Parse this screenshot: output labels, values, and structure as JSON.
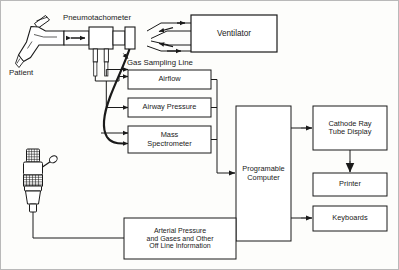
{
  "figure": {
    "width": 399,
    "height": 270,
    "line_color": "#1a1a1a",
    "box_fill": "#ffffff",
    "background": "#fdfdfb"
  },
  "boxes": {
    "ventilator": {
      "label": "Ventilator",
      "x": 190,
      "y": 14,
      "w": 86,
      "h": 37,
      "font_size": 8.2
    },
    "airflow": {
      "label": "Airflow",
      "x": 127,
      "y": 69,
      "w": 83,
      "h": 19,
      "font_size": 7.4
    },
    "airway_pressure": {
      "label": "Airway Pressure",
      "x": 127,
      "y": 97,
      "w": 83,
      "h": 19,
      "font_size": 7.4
    },
    "mass_spectrometer": {
      "label": "Mass\nSpectrometer",
      "x": 127,
      "y": 125,
      "w": 83,
      "h": 27,
      "font_size": 7.4
    },
    "computer": {
      "label": "Programable\nComputer",
      "x": 235,
      "y": 105,
      "w": 55,
      "h": 135,
      "font_size": 7.4
    },
    "crt": {
      "label": "Cathode Ray\nTube Display",
      "x": 312,
      "y": 105,
      "w": 74,
      "h": 44,
      "font_size": 7.4
    },
    "printer": {
      "label": "Printer",
      "x": 312,
      "y": 172,
      "w": 74,
      "h": 23,
      "font_size": 7.4
    },
    "keyboards": {
      "label": "Keyboards",
      "x": 312,
      "y": 205,
      "w": 74,
      "h": 25,
      "font_size": 7.4
    },
    "arterial": {
      "label": "Arterial Pressure\nand Gases and Other\nOff Line Information",
      "x": 123,
      "y": 217,
      "w": 112,
      "h": 41,
      "font_size": 7.0
    }
  },
  "labels": {
    "pneumotachometer": {
      "text": "Pneumotachometer",
      "x": 62,
      "y": 13,
      "font_size": 7.8
    },
    "patient": {
      "text": "Patient",
      "x": 8,
      "y": 68,
      "font_size": 7.8
    },
    "gas_sampling_line": {
      "text": "Gas Sampling Line",
      "x": 126,
      "y": 58,
      "font_size": 7.8
    }
  },
  "icons": {
    "patient_elbow_connector": "patient-elbow-connector-icon",
    "pneumotach_body": "pneumotachometer-icon",
    "sampling_ports": "sampling-port-icon",
    "pressure_transducer": "pressure-transducer-icon",
    "ventilator_flow_arrows": "flow-arrow-icon",
    "bidirectional_flow": "bidirectional-flow-arrow-icon"
  },
  "connections": [
    {
      "name": "pneumotach-to-ventilator-inspiratory",
      "from": "pneumotachometer",
      "to": "ventilator"
    },
    {
      "name": "ventilator-to-pneumotach-expiratory",
      "from": "ventilator",
      "to": "pneumotachometer"
    },
    {
      "name": "pneumotach-to-airflow",
      "from": "pneumotachometer",
      "to": "airflow"
    },
    {
      "name": "pneumotach-to-airway-pressure",
      "from": "pneumotachometer",
      "to": "airway_pressure"
    },
    {
      "name": "gas-line-to-mass-spectrometer",
      "from": "gas_sampling_line",
      "to": "mass_spectrometer"
    },
    {
      "name": "signals-bus-to-computer",
      "from": "airflow,airway_pressure,mass_spectrometer",
      "to": "computer"
    },
    {
      "name": "transducer-to-arterial-box",
      "from": "pressure_transducer",
      "to": "arterial"
    },
    {
      "name": "arterial-to-computer",
      "from": "arterial",
      "to": "computer"
    },
    {
      "name": "computer-to-crt",
      "from": "computer",
      "to": "crt"
    },
    {
      "name": "crt-to-printer",
      "from": "crt",
      "to": "printer"
    },
    {
      "name": "computer-to-keyboards",
      "from": "computer",
      "to": "keyboards"
    }
  ]
}
